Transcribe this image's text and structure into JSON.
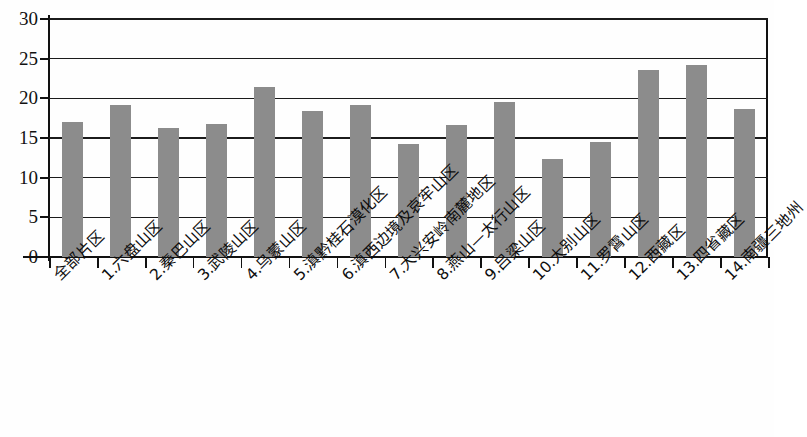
{
  "chart_data": {
    "type": "bar",
    "title": "",
    "subtitle": "",
    "xlabel": "",
    "ylabel": "",
    "ylim": [
      0,
      30
    ],
    "ytick_values": [
      0,
      5,
      10,
      15,
      20,
      25,
      30
    ],
    "ytick_labels": [
      "0",
      "5",
      "10",
      "15",
      "20",
      "25",
      "30"
    ],
    "grid": true,
    "grid_axis": "y",
    "legend": false,
    "legend_position": "none",
    "bar_color": "#8c8c8c",
    "axis_color": "#111111",
    "categories": [
      "全部片区",
      "1.六盘山区",
      "2.秦巴山区",
      "3.武陵山区",
      "4.乌蒙山区",
      "5.滇黔桂石漠化区",
      "6.滇西边境及哀牢山区",
      "7.大兴安岭南麓地区",
      "8.燕山—太行山区",
      "9.吕梁山区",
      "10.大别山区",
      "11.罗霄山区",
      "12.西藏区",
      "13.四省藏区",
      "14.南疆三地州"
    ],
    "values": [
      17.0,
      19.2,
      16.2,
      16.8,
      21.4,
      18.4,
      19.2,
      14.2,
      16.7,
      19.6,
      12.3,
      14.5,
      23.6,
      24.2,
      18.7
    ]
  }
}
